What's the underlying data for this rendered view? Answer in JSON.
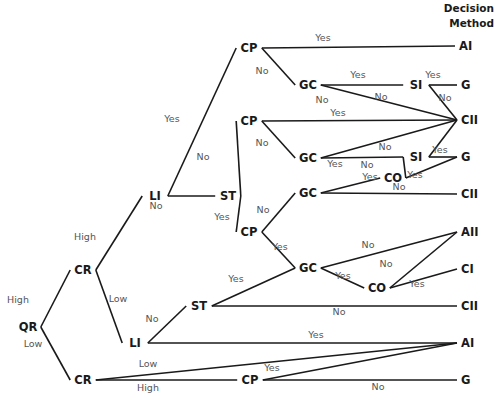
{
  "header": {
    "line1": "Decision",
    "line2": "Method"
  },
  "nodes": {
    "qr": {
      "label": "QR",
      "x": 28,
      "y": 327
    },
    "cr1": {
      "label": "CR",
      "x": 83,
      "y": 270
    },
    "cr2": {
      "label": "CR",
      "x": 83,
      "y": 380
    },
    "li1": {
      "label": "LI",
      "x": 155,
      "y": 196
    },
    "li2": {
      "label": "LI",
      "x": 135,
      "y": 343
    },
    "st1": {
      "label": "ST",
      "x": 228,
      "y": 196
    },
    "st2": {
      "label": "ST",
      "x": 199,
      "y": 306
    },
    "cp1": {
      "label": "CP",
      "x": 249,
      "y": 48
    },
    "cp2": {
      "label": "CP",
      "x": 249,
      "y": 121
    },
    "cp3": {
      "label": "CP",
      "x": 249,
      "y": 232
    },
    "cp4": {
      "label": "CP",
      "x": 250,
      "y": 380
    },
    "gc1": {
      "label": "GC",
      "x": 308,
      "y": 85
    },
    "gc2": {
      "label": "GC",
      "x": 308,
      "y": 158
    },
    "gc3": {
      "label": "GC",
      "x": 308,
      "y": 193
    },
    "gc4": {
      "label": "GC",
      "x": 308,
      "y": 268
    },
    "si1": {
      "label": "SI",
      "x": 416,
      "y": 85
    },
    "si2": {
      "label": "SI",
      "x": 416,
      "y": 157
    },
    "co1": {
      "label": "CO",
      "x": 393,
      "y": 178
    },
    "co2": {
      "label": "CO",
      "x": 377,
      "y": 288
    }
  },
  "leaves": {
    "ai1": {
      "label": "AI",
      "x": 464,
      "y": 46
    },
    "g1": {
      "label": "G",
      "x": 466,
      "y": 85
    },
    "cii1": {
      "label": "CII",
      "x": 466,
      "y": 120
    },
    "g2": {
      "label": "G",
      "x": 466,
      "y": 157
    },
    "cii2": {
      "label": "CII",
      "x": 466,
      "y": 194
    },
    "aii": {
      "label": "AII",
      "x": 466,
      "y": 232
    },
    "ci": {
      "label": "CI",
      "x": 466,
      "y": 269
    },
    "cii3": {
      "label": "CII",
      "x": 466,
      "y": 306
    },
    "ai2": {
      "label": "AI",
      "x": 466,
      "y": 343
    },
    "g3": {
      "label": "G",
      "x": 466,
      "y": 380
    }
  },
  "edges": [
    {
      "from": "qr",
      "to": "cr1",
      "label": "High"
    },
    {
      "from": "qr",
      "to": "cr2",
      "label": "Low"
    },
    {
      "from": "cr1",
      "to": "li1",
      "label": "High"
    },
    {
      "from": "cr1",
      "to": "li2",
      "label": "Low"
    },
    {
      "from": "li1",
      "to": "cp1",
      "label": "Yes"
    },
    {
      "from": "li1",
      "to": "st1",
      "label": "No"
    },
    {
      "from": "cp1",
      "to": "ai1",
      "label": "Yes"
    },
    {
      "from": "cp1",
      "to": "gc1",
      "label": "No"
    },
    {
      "from": "gc1",
      "to": "si1",
      "label": "Yes"
    },
    {
      "from": "gc1",
      "to": "cii1",
      "label": "No"
    },
    {
      "from": "si1",
      "to": "g1",
      "label": "Yes"
    },
    {
      "from": "si1",
      "to": "cii1",
      "label": "No"
    },
    {
      "from": "st1",
      "to": "cp2",
      "label": "No"
    },
    {
      "from": "st1",
      "to": "cp3",
      "label": "Yes"
    },
    {
      "from": "cp2",
      "to": "cii1",
      "label": "Yes"
    },
    {
      "from": "cp2",
      "to": "gc2",
      "label": "No"
    },
    {
      "from": "gc2",
      "to": "si2",
      "label": "Yes"
    },
    {
      "from": "gc2",
      "to": "cii1",
      "label": "No"
    },
    {
      "from": "si2",
      "to": "g2",
      "label": "Yes"
    },
    {
      "from": "si2",
      "to": "cii1",
      "label": "No"
    },
    {
      "from": "cp3",
      "to": "gc3",
      "label": "No"
    },
    {
      "from": "cp3",
      "to": "gc4",
      "label": "Yes"
    },
    {
      "from": "gc3",
      "to": "co1",
      "label": "Yes"
    },
    {
      "from": "gc3",
      "to": "cii2",
      "label": "No"
    },
    {
      "from": "co1",
      "to": "si2",
      "label": "No"
    },
    {
      "from": "co1",
      "to": "g2",
      "label": "Yes"
    },
    {
      "from": "gc4",
      "to": "aii",
      "label": "No"
    },
    {
      "from": "gc4",
      "to": "co2",
      "label": "Yes"
    },
    {
      "from": "co2",
      "to": "aii",
      "label": "No"
    },
    {
      "from": "co2",
      "to": "ci",
      "label": "Yes"
    },
    {
      "from": "li2",
      "to": "st2",
      "label": "No"
    },
    {
      "from": "li2",
      "to": "ai2",
      "label": "Yes"
    },
    {
      "from": "st2",
      "to": "gc4",
      "label": "Yes"
    },
    {
      "from": "st2",
      "to": "cii3",
      "label": "No"
    },
    {
      "from": "cr2",
      "to": "ai2",
      "label": "Low"
    },
    {
      "from": "cr2",
      "to": "cp4",
      "label": "High"
    },
    {
      "from": "cp4",
      "to": "ai2",
      "label": "Yes"
    },
    {
      "from": "cp4",
      "to": "g3",
      "label": "No"
    }
  ],
  "edge_labels": [
    {
      "text": "High",
      "x": 18,
      "y": 303
    },
    {
      "text": "Low",
      "x": 33,
      "y": 347
    },
    {
      "text": "High",
      "x": 85,
      "y": 240
    },
    {
      "text": "Low",
      "x": 118,
      "y": 302
    },
    {
      "text": "Yes",
      "x": 172,
      "y": 122
    },
    {
      "text": "No",
      "x": 156,
      "y": 209
    },
    {
      "text": "Yes",
      "x": 323,
      "y": 41
    },
    {
      "text": "No",
      "x": 262,
      "y": 74
    },
    {
      "text": "Yes",
      "x": 358,
      "y": 78
    },
    {
      "text": "No",
      "x": 322,
      "y": 103
    },
    {
      "text": "No",
      "x": 381,
      "y": 100
    },
    {
      "text": "Yes",
      "x": 433,
      "y": 78
    },
    {
      "text": "No",
      "x": 445,
      "y": 101
    },
    {
      "text": "No",
      "x": 203,
      "y": 160
    },
    {
      "text": "Yes",
      "x": 222,
      "y": 220
    },
    {
      "text": "Yes",
      "x": 338,
      "y": 116
    },
    {
      "text": "No",
      "x": 262,
      "y": 146
    },
    {
      "text": "No",
      "x": 385,
      "y": 150
    },
    {
      "text": "Yes",
      "x": 335,
      "y": 167
    },
    {
      "text": "No",
      "x": 367,
      "y": 168
    },
    {
      "text": "Yes",
      "x": 440,
      "y": 153
    },
    {
      "text": "Yes",
      "x": 370,
      "y": 180
    },
    {
      "text": "Yes",
      "x": 415,
      "y": 178
    },
    {
      "text": "No",
      "x": 399,
      "y": 190
    },
    {
      "text": "No",
      "x": 263,
      "y": 213
    },
    {
      "text": "Yes",
      "x": 280,
      "y": 250
    },
    {
      "text": "No",
      "x": 368,
      "y": 248
    },
    {
      "text": "No",
      "x": 386,
      "y": 267
    },
    {
      "text": "Yes",
      "x": 343,
      "y": 279
    },
    {
      "text": "Yes",
      "x": 417,
      "y": 287
    },
    {
      "text": "Yes",
      "x": 236,
      "y": 282
    },
    {
      "text": "No",
      "x": 339,
      "y": 315
    },
    {
      "text": "No",
      "x": 152,
      "y": 322
    },
    {
      "text": "Yes",
      "x": 316,
      "y": 338
    },
    {
      "text": "Low",
      "x": 148,
      "y": 367
    },
    {
      "text": "Yes",
      "x": 272,
      "y": 371
    },
    {
      "text": "High",
      "x": 148,
      "y": 391
    },
    {
      "text": "No",
      "x": 378,
      "y": 390
    }
  ]
}
